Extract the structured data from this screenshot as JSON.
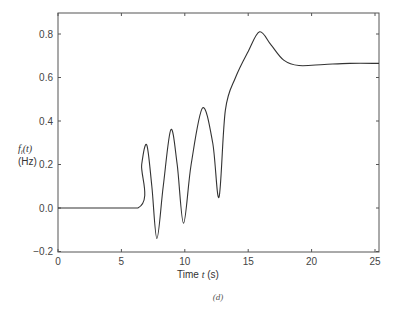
{
  "chart_data": {
    "type": "line",
    "title": "",
    "xlabel": "Time t (s)",
    "ylabel": "f_i(t) (Hz)",
    "xlim": [
      0,
      25.5
    ],
    "ylim": [
      -0.2,
      0.9
    ],
    "x_ticks": [
      0,
      5,
      10,
      15,
      20,
      25
    ],
    "y_ticks": [
      -0.2,
      0.0,
      0.2,
      0.4,
      0.6,
      0.8
    ],
    "x_tick_labels": [
      "0",
      "5",
      "10",
      "15",
      "20",
      "25"
    ],
    "y_tick_labels": [
      "−0.2",
      "0.0",
      "0.2",
      "0.4",
      "0.6",
      "0.8"
    ],
    "grid": false,
    "legend": null,
    "caption": "(d)",
    "series": [
      {
        "name": "f_i(t)",
        "color": "#333333",
        "x": [
          0,
          6.3,
          6.6,
          7.0,
          7.4,
          7.8,
          8.3,
          8.9,
          9.4,
          9.9,
          10.5,
          11.4,
          12.2,
          12.7,
          13.2,
          14.0,
          15.0,
          15.9,
          16.8,
          17.8,
          19.0,
          21.0,
          23.0,
          25.5
        ],
        "y": [
          0,
          0,
          0.2,
          0.29,
          0.1,
          -0.14,
          0.1,
          0.36,
          0.2,
          -0.07,
          0.2,
          0.46,
          0.3,
          0.05,
          0.45,
          0.6,
          0.72,
          0.81,
          0.75,
          0.68,
          0.655,
          0.66,
          0.665,
          0.665
        ]
      }
    ]
  },
  "labels": {
    "y_axis_symbol": "f",
    "y_axis_sub": "i",
    "y_axis_arg": "(t)",
    "y_axis_unit": "(Hz)",
    "x_axis_text": "Time ",
    "x_axis_var": "t",
    "x_axis_unit": " (s)",
    "caption": "(d)"
  }
}
